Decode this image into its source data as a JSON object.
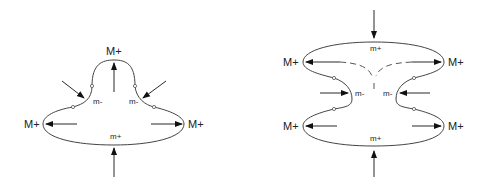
{
  "diagrams": [
    {
      "name": "left-shape",
      "labels": {
        "top": "M+",
        "left": "M+",
        "right": "M+",
        "inner_left": "m-",
        "inner_right": "m-",
        "bottom": "m+"
      }
    },
    {
      "name": "right-shape",
      "labels": {
        "top_left": "M+",
        "top_right": "M+",
        "bottom_left": "M+",
        "bottom_right": "M+",
        "top_inner": "m+",
        "bottom_inner": "m+",
        "waist_left": "m-",
        "waist_right": "m-"
      }
    }
  ],
  "colors": {
    "line": "#444444",
    "text": "#222222"
  }
}
